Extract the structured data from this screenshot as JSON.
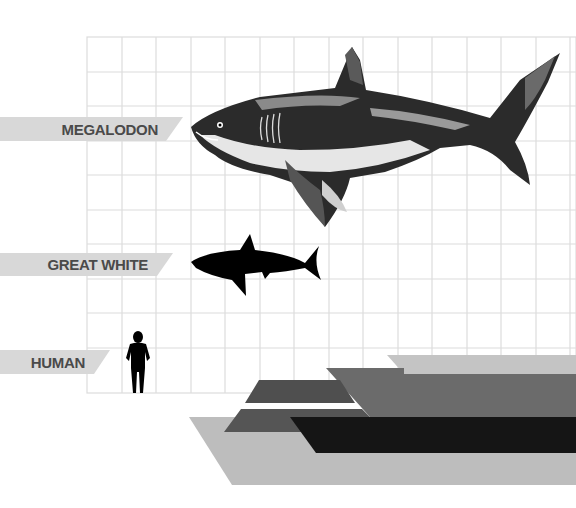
{
  "diagram": {
    "title": "",
    "grid": {
      "x0": 87,
      "y0": 37,
      "cell": 34.4,
      "cols": 14,
      "rows": 10,
      "line_color": "#dcdcdc"
    },
    "labels": [
      {
        "id": "megalodon",
        "text": "MEGALODON"
      },
      {
        "id": "great-white",
        "text": "GREAT WHITE"
      },
      {
        "id": "human",
        "text": "HUMAN"
      }
    ],
    "colors": {
      "label_band": "#d8d8d8",
      "label_text": "#4a4a4a",
      "shape_light": "#bdbdbd",
      "shape_mid": "#6b6b6b",
      "shape_dark": "#4a4a4a",
      "shape_black": "#151515",
      "silhouette": "#000000"
    }
  }
}
